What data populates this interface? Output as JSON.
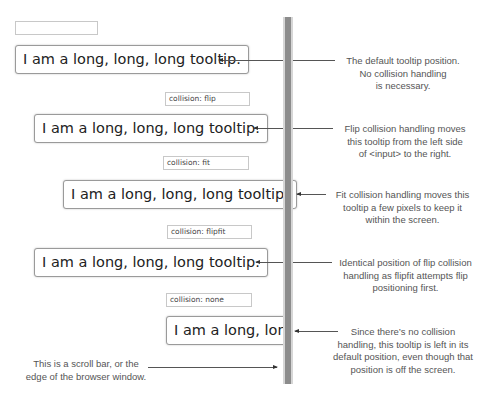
{
  "scrollbar": {
    "label": "scroll bar / browser edge"
  },
  "examples": [
    {
      "input_value": "",
      "tooltip": "I am a long, long, long tooltip.",
      "note": "The default tooltip position.\nNo collision handling\nis necessary."
    },
    {
      "input_value": "collision: flip",
      "tooltip": "I am a long, long, long tooltip.",
      "note": "Flip collision handling moves\nthis tooltip from the left side\nof <input> to the right."
    },
    {
      "input_value": "collision: fit",
      "tooltip": "I am a long, long, long tooltip.",
      "note": "Fit collision handling moves this\ntooltip a few pixels to keep it\nwithin the screen."
    },
    {
      "input_value": "collision: flipfit",
      "tooltip": "I am a long, long, long tooltip.",
      "note": "Identical position of flip collision\nhandling as flipfit attempts flip\npositioning first."
    },
    {
      "input_value": "collision: none",
      "tooltip": "I am a long, long, long tooltip.",
      "note": "Since there’s no collision\nhandling, this tooltip is left in its\ndefault position, even though that\nposition is off the screen."
    }
  ],
  "scrollbar_note": "This is a scroll bar, or the\nedge of the browser window.",
  "colors": {
    "scrollbar_thumb": "#8c8c8c",
    "scrollbar_track": "#d6d6d6",
    "annotation_text": "#555555"
  }
}
